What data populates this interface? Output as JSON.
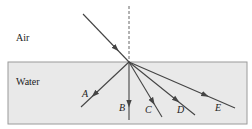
{
  "diagram": {
    "type": "refraction",
    "colors": {
      "background": "#ffffff",
      "water_fill": "#e9e9e9",
      "water_border": "#9a9a9a",
      "ray": "#444444",
      "normal": "#666666",
      "text": "#222222"
    },
    "regions": {
      "air": {
        "label": "Air",
        "x": 16,
        "y": 41
      },
      "water": {
        "label": "Water",
        "x": 16,
        "y": 85
      }
    },
    "water_box": {
      "x": 8,
      "y": 62,
      "width": 239,
      "height": 62
    },
    "normal_line": {
      "x": 129,
      "y1": 6,
      "y2": 62,
      "style": "dashed"
    },
    "incident_ray": {
      "x1": 83,
      "y1": 14,
      "x2": 129,
      "y2": 62
    },
    "refracted_rays": [
      {
        "id": "A",
        "label": "A",
        "x2": 81,
        "y2": 107,
        "label_x": 82,
        "label_y": 97
      },
      {
        "id": "B",
        "label": "B",
        "x2": 129,
        "y2": 120,
        "label_x": 119,
        "label_y": 111
      },
      {
        "id": "C",
        "label": "C",
        "x2": 162,
        "y2": 117,
        "label_x": 145,
        "label_y": 113
      },
      {
        "id": "D",
        "label": "D",
        "x2": 195,
        "y2": 115,
        "label_x": 177,
        "label_y": 113
      },
      {
        "id": "E",
        "label": "E",
        "x2": 235,
        "y2": 108,
        "label_x": 215,
        "label_y": 111
      }
    ]
  }
}
